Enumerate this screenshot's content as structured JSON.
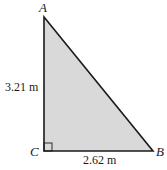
{
  "diagram": {
    "type": "right-triangle",
    "fill_color": "#d9d9d9",
    "stroke_color": "#1a1a1a",
    "vertices": {
      "A": {
        "label": "A"
      },
      "B": {
        "label": "B"
      },
      "C": {
        "label": "C"
      }
    },
    "sides": {
      "AC": {
        "label": "3.21 m"
      },
      "CB": {
        "label": "2.62 m"
      }
    },
    "right_angle_at": "C"
  }
}
